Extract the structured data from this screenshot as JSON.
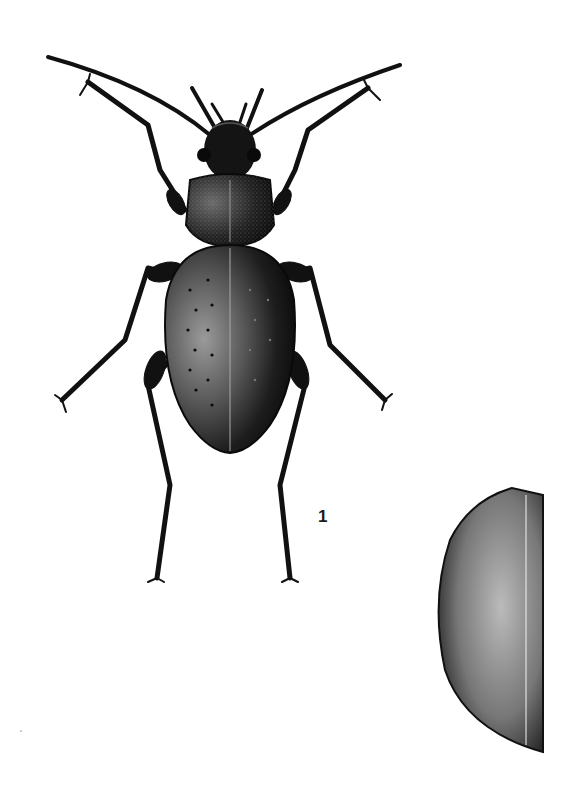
{
  "plate": {
    "background": "#ffffff",
    "ink_color": "#111111",
    "figures": [
      {
        "id": "habitus",
        "description": "ground beetle, dorsal view",
        "label": "1"
      },
      {
        "id": "elytron-detail",
        "description": "elytron detail, stippled"
      }
    ]
  }
}
